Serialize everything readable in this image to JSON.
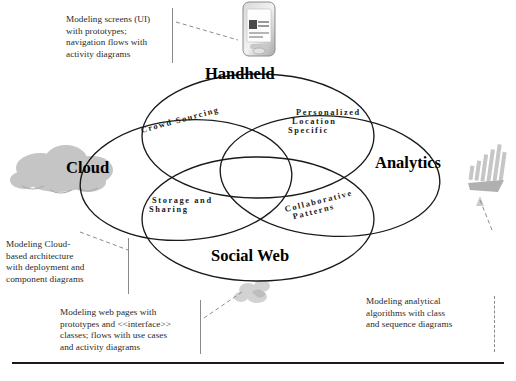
{
  "figure": {
    "type": "venn-diagram",
    "sets": [
      {
        "id": "handheld",
        "label": "Handheld"
      },
      {
        "id": "cloud",
        "label": "Cloud"
      },
      {
        "id": "analytics",
        "label": "Analytics"
      },
      {
        "id": "social",
        "label": "Social Web"
      }
    ],
    "intersections": [
      {
        "id": "crowd-sourcing",
        "lines": [
          "Crowd Sourcing"
        ]
      },
      {
        "id": "personalized-location",
        "lines": [
          "Personalized",
          "Location",
          "Specific"
        ]
      },
      {
        "id": "storage-sharing",
        "lines": [
          "Storage and",
          "Sharing"
        ]
      },
      {
        "id": "collaborative-patterns",
        "lines": [
          "Collaborative",
          "Patterns"
        ]
      }
    ],
    "callouts": [
      {
        "id": "handheld",
        "text": "Modeling screens (UI)\nwith prototypes;\nnavigation flows with\nactivity diagrams"
      },
      {
        "id": "cloud",
        "text": "Modeling Cloud-\nbased architecture\nwith deployment and\ncomponent diagrams"
      },
      {
        "id": "social-web",
        "text": "Modeling web pages with\nprototypes and <<interface>>\nclasses; flows with use cases\nand activity diagrams"
      },
      {
        "id": "analytics",
        "text": "Modeling analytical\nalgorithms with class\nand sequence diagrams"
      }
    ],
    "icons": [
      {
        "id": "smartphone",
        "name": "smartphone-icon"
      },
      {
        "id": "cloud",
        "name": "cloud-icon"
      },
      {
        "id": "bar-chart",
        "name": "bar-chart-icon"
      },
      {
        "id": "social",
        "name": "social-web-icon"
      }
    ],
    "colors": {
      "stroke": "#1a1a1a",
      "text": "#1a1a1a",
      "callout_text": "#2a2a2a",
      "leader_line": "#8a8a8a",
      "icon_gray": "#b4b4b4"
    }
  },
  "caption": {
    "partial_text": " "
  }
}
